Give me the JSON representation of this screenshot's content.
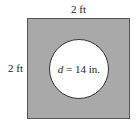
{
  "diagram": {
    "square": {
      "top_side_label": "2 ft",
      "left_side_label": "2 ft",
      "fill_color": "#a9a9a9"
    },
    "circle": {
      "variable": "d",
      "equals": " = 14 in.",
      "fill_color": "#ffffff"
    }
  }
}
